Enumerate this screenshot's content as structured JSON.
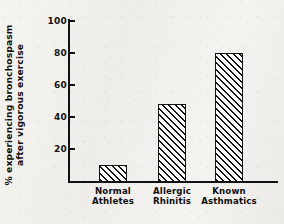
{
  "chart_data": {
    "type": "bar",
    "title": "",
    "subtitle": "",
    "xlabel": "",
    "ylabel": "% experiencing bronchospasm after vigorous exercise",
    "ylabel_lines": [
      "% experiencing bronchospasm",
      "after vigorous exercise"
    ],
    "categories": [
      "Normal Athletes",
      "Allergic Rhinitis",
      "Known Asthmatics"
    ],
    "category_lines": [
      [
        "Normal",
        "Athletes"
      ],
      [
        "Allergic",
        "Rhinitis"
      ],
      [
        "Known",
        "Asthmatics"
      ]
    ],
    "values": [
      10,
      48,
      80
    ],
    "ylim": [
      0,
      100
    ],
    "yticks": [
      20,
      40,
      60,
      80,
      100
    ],
    "ytick_labels": [
      "20",
      "40",
      "60",
      "80",
      "100"
    ],
    "grid": false,
    "legend": null,
    "bar_fill": "diagonal-hatch",
    "colors": {
      "axis": "#121110",
      "bar_outline": "#141312",
      "bar_hatch": "#151413",
      "bar_background": "#fbfaf8",
      "text": "#0f0e0d",
      "page_background": "#f4f2ef"
    }
  }
}
